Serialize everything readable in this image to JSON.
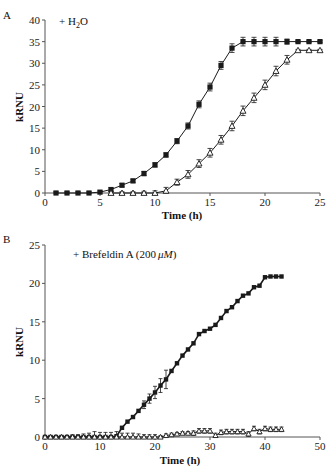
{
  "chart_data": [
    {
      "panel": "A",
      "type": "line",
      "title": "",
      "annotation": "+ H2O",
      "annotation_parts": {
        "prefix": "+ H",
        "sub": "2",
        "suffix": "O"
      },
      "xlabel": "Time (h)",
      "ylabel": "kRNU",
      "xlim": [
        0,
        25
      ],
      "ylim": [
        0,
        40
      ],
      "xticks": [
        0,
        5,
        10,
        15,
        20,
        25
      ],
      "yticks": [
        0,
        5,
        10,
        15,
        20,
        25,
        30,
        35,
        40
      ],
      "grid": false,
      "legend": null,
      "series": [
        {
          "name": "filled squares",
          "marker": "square-filled",
          "x": [
            1,
            2,
            3,
            4,
            5,
            6,
            7,
            8,
            9,
            10,
            11,
            12,
            13,
            14,
            15,
            16,
            17,
            18,
            19,
            20,
            21,
            22,
            23,
            24,
            25
          ],
          "values": [
            0,
            0,
            0,
            0,
            0.2,
            0.8,
            1.8,
            2.8,
            4.5,
            6.5,
            8.8,
            12,
            15.5,
            20.5,
            24.5,
            29.5,
            33.5,
            35,
            35,
            35,
            35,
            35,
            35,
            35,
            35
          ],
          "error": [
            0.3,
            0.3,
            0.3,
            0.3,
            0.3,
            0.4,
            0.4,
            0.4,
            0.5,
            0.5,
            0.5,
            0.6,
            0.7,
            0.8,
            0.9,
            0.9,
            1.0,
            1.0,
            1.0,
            1.0,
            1.0,
            0.6,
            0.2,
            0.2,
            0.2
          ]
        },
        {
          "name": "open triangles",
          "marker": "triangle-open",
          "x": [
            6,
            7,
            8,
            9,
            10,
            11,
            12,
            13,
            14,
            15,
            16,
            17,
            18,
            19,
            20,
            21,
            22,
            23,
            24,
            25
          ],
          "values": [
            0,
            0,
            0,
            0,
            0,
            0.5,
            2.5,
            4.3,
            6.8,
            9.3,
            12.3,
            15.5,
            19,
            22,
            25,
            28.2,
            30.8,
            33,
            33,
            33
          ],
          "error": [
            0.3,
            0.3,
            0.3,
            0.4,
            0.5,
            0.8,
            0.7,
            0.9,
            0.9,
            1.0,
            1.0,
            1.1,
            1.1,
            1.1,
            1.1,
            1.1,
            1.0,
            0.2,
            0.2,
            0.2
          ]
        }
      ]
    },
    {
      "panel": "B",
      "type": "line",
      "title": "",
      "annotation": "+ Brefeldin A (200 μM)",
      "annotation_parts": {
        "prefix": "+ Brefeldin A (200 ",
        "italic": "μM",
        "suffix": ")"
      },
      "xlabel": "Time (h)",
      "ylabel": "kRNU",
      "xlim": [
        0,
        50
      ],
      "ylim": [
        0,
        25
      ],
      "xticks": [
        0,
        10,
        20,
        30,
        40,
        50
      ],
      "yticks": [
        0,
        5,
        10,
        15,
        20,
        25
      ],
      "grid": false,
      "legend": null,
      "series": [
        {
          "name": "filled squares",
          "marker": "square-filled",
          "x": [
            0,
            1,
            2,
            3,
            4,
            5,
            6,
            7,
            8,
            9,
            10,
            11,
            12,
            13,
            14,
            15,
            16,
            17,
            18,
            19,
            20,
            21,
            22,
            23,
            24,
            25,
            26,
            27,
            28,
            29,
            30,
            31,
            32,
            33,
            34,
            35,
            36,
            37,
            38,
            39,
            40,
            41,
            42,
            43
          ],
          "values": [
            0,
            0,
            0,
            0,
            0,
            0,
            0,
            0,
            0,
            0,
            0,
            0,
            0,
            0.1,
            1.2,
            2,
            2.6,
            3.4,
            4.2,
            5,
            5.8,
            6.7,
            7.5,
            8.6,
            9.6,
            10.6,
            11.4,
            12.2,
            13.4,
            13.8,
            14.1,
            14.6,
            15.5,
            16.4,
            16.9,
            17.7,
            18.4,
            18.7,
            19.5,
            19.7,
            20.8,
            20.9,
            20.9,
            20.9
          ],
          "error": [
            0,
            0,
            0,
            0,
            0,
            0,
            0,
            0,
            0,
            0,
            0,
            0,
            0,
            0,
            0,
            0,
            0,
            0,
            0.5,
            0.6,
            0.8,
            0.9,
            1.2,
            0,
            0,
            0,
            0,
            0,
            0,
            0,
            0,
            0,
            0,
            0,
            0,
            0,
            0,
            0,
            0,
            0,
            0,
            0,
            0,
            0
          ]
        },
        {
          "name": "open triangles",
          "marker": "triangle-open",
          "x": [
            0,
            1,
            2,
            3,
            4,
            5,
            6,
            7,
            8,
            9,
            10,
            11,
            12,
            13,
            14,
            15,
            16,
            17,
            18,
            19,
            20,
            21,
            22,
            23,
            24,
            25,
            26,
            27,
            28,
            29,
            30,
            31,
            32,
            33,
            34,
            35,
            36,
            37,
            38,
            39,
            40,
            41,
            42,
            43
          ],
          "values": [
            0,
            0,
            0,
            0,
            0,
            0,
            0,
            0,
            0,
            0,
            0,
            0,
            0,
            0,
            0,
            0,
            0,
            0,
            0,
            0,
            0,
            0,
            0.2,
            0.3,
            0.4,
            0.5,
            0.5,
            0.5,
            0.8,
            0.8,
            0.8,
            0.2,
            0.6,
            0.7,
            0.7,
            0.7,
            0.7,
            0.4,
            1.1,
            0.7,
            1.1,
            1.0,
            1.0,
            1.0
          ],
          "error": [
            0.2,
            0.2,
            0.2,
            0.2,
            0.2,
            0.3,
            0.3,
            0.4,
            0.5,
            0.7,
            0.6,
            0.6,
            0.6,
            0.7,
            0.5,
            0.5,
            0.5,
            0.4,
            0.3,
            0.3,
            0.3,
            0.2,
            0.2,
            0.2,
            0.2,
            0.2,
            0.2,
            0.3,
            0.3,
            0.3,
            0.3,
            0.3,
            0.3,
            0.3,
            0.3,
            0.3,
            0.3,
            0.3,
            0.3,
            0.3,
            0.3,
            0.3,
            0.3,
            0.3
          ]
        }
      ]
    }
  ],
  "colors": {
    "line": "#1a1a1a",
    "axis": "#555555",
    "background": "#ffffff"
  }
}
